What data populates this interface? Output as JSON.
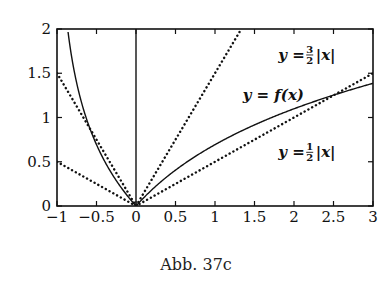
{
  "figure": {
    "caption": "Abb. 37c"
  },
  "chart_data": {
    "type": "line",
    "title": "",
    "xlabel": "",
    "ylabel": "",
    "xlim": [
      -1,
      3
    ],
    "ylim": [
      0,
      2
    ],
    "grid": false,
    "x_ticks": [
      "-1",
      "-0.5",
      "0",
      "0.5",
      "1",
      "1.5",
      "2",
      "2.5",
      "3"
    ],
    "y_ticks": [
      "0",
      "0.5",
      "1",
      "1.5",
      "2"
    ],
    "series": [
      {
        "name": "y = f(x)",
        "style": "solid",
        "formula": "|ln(1+x)|",
        "x": [
          -0.85,
          -0.8,
          -0.7,
          -0.6,
          -0.5,
          -0.4,
          -0.3,
          -0.2,
          -0.1,
          0,
          0.25,
          0.5,
          0.75,
          1,
          1.5,
          2,
          2.5,
          3
        ],
        "y": [
          1.9,
          1.61,
          1.2,
          0.92,
          0.69,
          0.51,
          0.36,
          0.22,
          0.11,
          0,
          0.22,
          0.41,
          0.56,
          0.69,
          0.92,
          1.1,
          1.25,
          1.39
        ]
      },
      {
        "name": "y = 3/2 |x|",
        "style": "dotted",
        "x": [
          -1,
          0,
          1.333
        ],
        "y": [
          1.5,
          0,
          2
        ]
      },
      {
        "name": "y = 1/2 |x|",
        "style": "dotted",
        "x": [
          -1,
          0,
          3
        ],
        "y": [
          0.5,
          0,
          1.5
        ]
      }
    ],
    "annotations": [
      {
        "text_prefix": "y = ",
        "num": "3",
        "den": "2",
        "text_suffix": "|x|",
        "x": 1.8,
        "y": 1.65
      },
      {
        "text": "y = f(x)",
        "x": 1.35,
        "y": 1.2
      },
      {
        "text_prefix": "y = ",
        "num": "1",
        "den": "2",
        "text_suffix": "|x|",
        "x": 1.8,
        "y": 0.55
      }
    ]
  }
}
